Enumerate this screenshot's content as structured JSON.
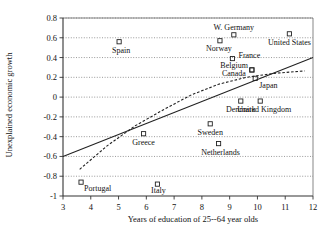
{
  "chart_data": {
    "type": "scatter",
    "title": "",
    "xlabel": "Years of education of 25--64 year olds",
    "ylabel": "Unexplained economic growth",
    "xlim": [
      3,
      12
    ],
    "ylim": [
      -1,
      0.8
    ],
    "xticks": [
      "3",
      "4",
      "5",
      "6",
      "7",
      "8",
      "9",
      "10",
      "11",
      "12"
    ],
    "yticks": [
      "0.8",
      "0.6",
      "0.4",
      "0.2",
      "0",
      "-0.2",
      "-0.4",
      "-0.6",
      "-0.8",
      "-1"
    ],
    "xtick_values": [
      3,
      4,
      5,
      6,
      7,
      8,
      9,
      10,
      11,
      12
    ],
    "ytick_values": [
      0.8,
      0.6,
      0.4,
      0.2,
      0,
      -0.2,
      -0.4,
      -0.6,
      -0.8,
      -1
    ],
    "grid": true,
    "legend": "none",
    "marker_style": "open-square",
    "points": [
      {
        "label": "Spain",
        "x": 5.02,
        "y": 0.56,
        "label_dx": 2,
        "label_dy": 11,
        "anchor": "middle"
      },
      {
        "label": "W. Germany",
        "x": 9.15,
        "y": 0.63,
        "label_dx": 0,
        "label_dy": -5,
        "anchor": "middle"
      },
      {
        "label": "United States",
        "x": 11.15,
        "y": 0.64,
        "label_dx": 0,
        "label_dy": 11,
        "anchor": "middle"
      },
      {
        "label": "Norway",
        "x": 8.65,
        "y": 0.57,
        "label_dx": -1,
        "label_dy": 10,
        "anchor": "middle"
      },
      {
        "label": "France",
        "x": 9.1,
        "y": 0.39,
        "label_dx": 6,
        "label_dy": -1,
        "anchor": "start"
      },
      {
        "label": "Belgium",
        "x": 9.8,
        "y": 0.275,
        "label_dx": -4,
        "label_dy": -2,
        "anchor": "end"
      },
      {
        "label": "Canada",
        "x": 9.8,
        "y": 0.275,
        "label_dx": -6,
        "label_dy": 6,
        "anchor": "end"
      },
      {
        "label": "Japan",
        "x": 9.92,
        "y": 0.19,
        "label_dx": 4,
        "label_dy": 10,
        "anchor": "start"
      },
      {
        "label": "Denmark",
        "x": 9.4,
        "y": -0.04,
        "label_dx": 0,
        "label_dy": 11,
        "anchor": "middle"
      },
      {
        "label": "United Kingdom",
        "x": 10.1,
        "y": -0.04,
        "label_dx": 4,
        "label_dy": 11,
        "anchor": "middle"
      },
      {
        "label": "Sweden",
        "x": 8.3,
        "y": -0.27,
        "label_dx": 0,
        "label_dy": 11,
        "anchor": "middle"
      },
      {
        "label": "Greece",
        "x": 5.9,
        "y": -0.37,
        "label_dx": 0,
        "label_dy": 11,
        "anchor": "middle"
      },
      {
        "label": "Netherlands",
        "x": 8.6,
        "y": -0.47,
        "label_dx": 2,
        "label_dy": 11,
        "anchor": "middle"
      },
      {
        "label": "Portugal",
        "x": 3.65,
        "y": -0.86,
        "label_dx": 3,
        "label_dy": 9,
        "anchor": "start"
      },
      {
        "label": "Italy",
        "x": 6.4,
        "y": -0.88,
        "label_dx": 1,
        "label_dy": 9,
        "anchor": "middle"
      }
    ],
    "trend_lines": [
      {
        "name": "solid-regression-line",
        "style": "solid",
        "path": [
          [
            3.0,
            -0.6
          ],
          [
            12.0,
            0.4
          ]
        ]
      },
      {
        "name": "dashed-regression-line",
        "style": "dashed",
        "path": [
          [
            3.6,
            -0.73
          ],
          [
            4.6,
            -0.49
          ],
          [
            5.6,
            -0.29
          ],
          [
            6.6,
            -0.13
          ],
          [
            7.6,
            0.02
          ],
          [
            8.6,
            0.13
          ],
          [
            9.6,
            0.2
          ],
          [
            10.6,
            0.24
          ],
          [
            11.7,
            0.265
          ]
        ]
      }
    ]
  }
}
